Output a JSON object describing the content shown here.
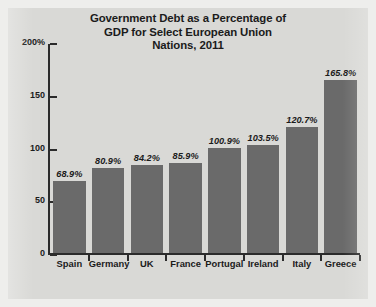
{
  "chart_data": {
    "type": "bar",
    "title": "Government Debt as a Percentage of GDP for Select European Union Nations, 2011",
    "title_lines": [
      "Government Debt as a Percentage of",
      "GDP for Select European Union",
      "Nations, 2011"
    ],
    "xlabel": "",
    "ylabel": "",
    "ylim": [
      0,
      200
    ],
    "grid": false,
    "legend": "none",
    "y_ticks": [
      {
        "value": 200,
        "label": "200%"
      },
      {
        "value": 150,
        "label": "150"
      },
      {
        "value": 100,
        "label": "100"
      },
      {
        "value": 50,
        "label": "50"
      },
      {
        "value": 0,
        "label": "0"
      }
    ],
    "categories": [
      "Spain",
      "Germany",
      "UK",
      "France",
      "Portugal",
      "Ireland",
      "Italy",
      "Greece"
    ],
    "values": [
      68.9,
      80.9,
      84.2,
      85.9,
      100.9,
      103.5,
      120.7,
      165.8
    ],
    "value_labels": [
      "68.9%",
      "80.9%",
      "84.2%",
      "85.9%",
      "100.9%",
      "103.5%",
      "120.7%",
      "165.8%"
    ],
    "colors": {
      "bar": "#6a6a6a",
      "plot_background": "#d9d9d6",
      "figure_border": "#eeeeec",
      "axis": "#2b2b2b",
      "text": "#1b1b1b"
    }
  }
}
